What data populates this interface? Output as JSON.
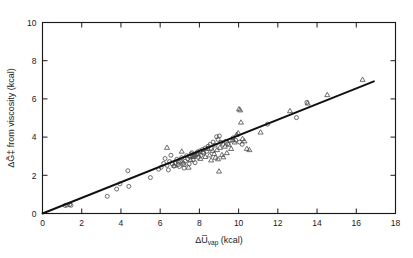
{
  "figure": {
    "background_color": "#ffffff",
    "foreground_color": "#1a1a1a"
  },
  "chart_data": {
    "type": "scatter",
    "title": "",
    "xlabel": "ΔU̅vap (kcal)",
    "xlabel_main": "ΔU̅",
    "xlabel_sub": "vap",
    "xlabel_unit": " (kcal)",
    "ylabel": "ΔG̃‡ from viscosity (kcal)",
    "ylabel_main": "ΔG̃‡",
    "ylabel_rest": " from viscosity (kcal)",
    "xlim": [
      0,
      18
    ],
    "ylim": [
      0,
      10
    ],
    "xticks": [
      0,
      2,
      4,
      6,
      8,
      10,
      12,
      14,
      16,
      18
    ],
    "yticks": [
      0,
      2,
      4,
      6,
      8,
      10
    ],
    "xtick_labels": [
      "0",
      "2",
      "4",
      "6",
      "8",
      "10",
      "12",
      "14",
      "16",
      "18"
    ],
    "ytick_labels": [
      "0",
      "2",
      "4",
      "6",
      "8",
      "10"
    ],
    "grid": false,
    "legend": null,
    "legend_position": "none",
    "fit_line": {
      "name": "fitted line",
      "x": [
        0.0,
        16.9
      ],
      "y": [
        0.0,
        6.92
      ],
      "slope": 0.41,
      "intercept": 0.0,
      "color": "#111111"
    },
    "series": [
      {
        "name": "circles",
        "marker": "circle",
        "fill": "none",
        "color": "#4a4a4a",
        "points": [
          [
            1.15,
            0.42
          ],
          [
            1.25,
            0.44
          ],
          [
            1.38,
            0.46
          ],
          [
            1.45,
            0.43
          ],
          [
            3.3,
            0.9
          ],
          [
            3.78,
            1.28
          ],
          [
            3.95,
            1.55
          ],
          [
            4.35,
            2.24
          ],
          [
            4.4,
            1.42
          ],
          [
            5.5,
            1.88
          ],
          [
            5.92,
            2.32
          ],
          [
            6.05,
            2.42
          ],
          [
            6.18,
            2.62
          ],
          [
            6.25,
            2.88
          ],
          [
            6.35,
            2.52
          ],
          [
            6.42,
            2.28
          ],
          [
            6.48,
            2.72
          ],
          [
            6.55,
            3.05
          ],
          [
            6.62,
            2.6
          ],
          [
            6.7,
            2.48
          ],
          [
            6.78,
            2.62
          ],
          [
            6.85,
            2.84
          ],
          [
            6.92,
            2.56
          ],
          [
            6.98,
            2.46
          ],
          [
            7.05,
            2.7
          ],
          [
            7.1,
            2.92
          ],
          [
            7.18,
            2.64
          ],
          [
            7.22,
            2.38
          ],
          [
            7.28,
            2.74
          ],
          [
            7.35,
            3.02
          ],
          [
            7.4,
            2.86
          ],
          [
            7.48,
            2.6
          ],
          [
            7.52,
            2.96
          ],
          [
            7.58,
            3.12
          ],
          [
            7.62,
            3.18
          ],
          [
            7.68,
            2.8
          ],
          [
            7.72,
            3.05
          ],
          [
            7.78,
            2.66
          ],
          [
            7.85,
            3.1
          ],
          [
            7.9,
            3.22
          ],
          [
            7.95,
            2.94
          ],
          [
            8.02,
            3.28
          ],
          [
            8.08,
            3.04
          ],
          [
            8.15,
            3.34
          ],
          [
            8.22,
            3.16
          ],
          [
            8.3,
            3.42
          ],
          [
            8.38,
            3.26
          ],
          [
            8.45,
            3.52
          ],
          [
            8.55,
            3.62
          ],
          [
            8.62,
            3.4
          ],
          [
            8.7,
            3.74
          ],
          [
            8.8,
            3.58
          ],
          [
            8.88,
            4.02
          ],
          [
            8.95,
            3.88
          ],
          [
            9.02,
            4.06
          ],
          [
            9.1,
            3.72
          ],
          [
            9.2,
            3.62
          ],
          [
            9.35,
            3.78
          ],
          [
            9.45,
            3.66
          ],
          [
            9.58,
            3.82
          ],
          [
            9.72,
            3.96
          ],
          [
            9.85,
            3.84
          ],
          [
            10.05,
            3.74
          ],
          [
            10.18,
            3.62
          ],
          [
            11.48,
            4.68
          ],
          [
            12.95,
            5.02
          ],
          [
            13.48,
            5.82
          ]
        ]
      },
      {
        "name": "triangles",
        "marker": "triangle",
        "fill": "none",
        "color": "#4a4a4a",
        "points": [
          [
            6.35,
            3.46
          ],
          [
            6.72,
            2.52
          ],
          [
            6.95,
            2.74
          ],
          [
            7.1,
            3.26
          ],
          [
            7.22,
            2.58
          ],
          [
            7.45,
            2.42
          ],
          [
            7.55,
            2.82
          ],
          [
            7.62,
            3.02
          ],
          [
            7.7,
            2.98
          ],
          [
            7.8,
            3.06
          ],
          [
            7.92,
            3.14
          ],
          [
            8.05,
            2.88
          ],
          [
            8.18,
            3.22
          ],
          [
            8.3,
            2.98
          ],
          [
            8.42,
            3.4
          ],
          [
            8.52,
            3.06
          ],
          [
            8.6,
            2.8
          ],
          [
            8.68,
            3.3
          ],
          [
            8.75,
            3.14
          ],
          [
            8.82,
            2.94
          ],
          [
            8.9,
            3.34
          ],
          [
            8.95,
            2.86
          ],
          [
            9.0,
            2.22
          ],
          [
            9.05,
            3.46
          ],
          [
            9.15,
            3.08
          ],
          [
            9.22,
            2.96
          ],
          [
            9.3,
            3.52
          ],
          [
            9.4,
            3.18
          ],
          [
            9.5,
            3.62
          ],
          [
            9.62,
            3.4
          ],
          [
            9.7,
            3.86
          ],
          [
            9.8,
            3.74
          ],
          [
            9.9,
            4.14
          ],
          [
            9.98,
            4.22
          ],
          [
            10.02,
            5.48
          ],
          [
            10.08,
            5.42
          ],
          [
            10.12,
            4.78
          ],
          [
            10.2,
            3.92
          ],
          [
            10.3,
            3.8
          ],
          [
            10.42,
            3.4
          ],
          [
            10.55,
            3.34
          ],
          [
            11.12,
            4.26
          ],
          [
            12.62,
            5.38
          ],
          [
            13.52,
            5.78
          ],
          [
            14.52,
            6.22
          ],
          [
            16.32,
            7.02
          ]
        ]
      }
    ]
  }
}
